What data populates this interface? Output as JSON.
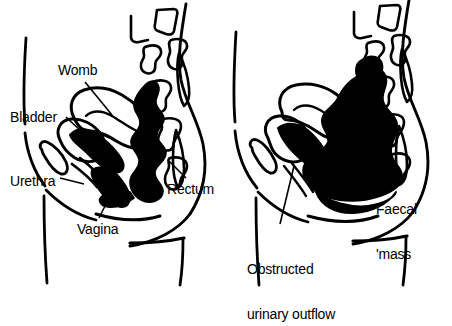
{
  "figure": {
    "type": "medical-line-diagram",
    "background_color": "#ffffff",
    "ink_color": "#000000",
    "panel_count": 2
  },
  "panels": [
    {
      "id": "normal",
      "name": "normal-pelvis-panel",
      "labels": [
        {
          "id": "womb",
          "name": "label-womb",
          "text": "Womb",
          "x": 58,
          "y": 63,
          "leader": true
        },
        {
          "id": "bladder",
          "name": "label-bladder",
          "text": "Bladder",
          "x": 10,
          "y": 110,
          "leader": true
        },
        {
          "id": "urethra",
          "name": "label-urethra",
          "text": "Urethra",
          "x": 10,
          "y": 174,
          "leader": true
        },
        {
          "id": "vagina",
          "name": "label-vagina",
          "text": "Vagina",
          "x": 77,
          "y": 222,
          "leader": true
        },
        {
          "id": "rectum",
          "name": "label-rectum",
          "text": "Rectum",
          "x": 167,
          "y": 182,
          "leader": true
        }
      ]
    },
    {
      "id": "impacted",
      "name": "impacted-pelvis-panel",
      "labels": [
        {
          "id": "faecal-mass",
          "name": "label-faecal-mass",
          "text_line1": "Faecal",
          "text_line2": "'mass",
          "x": 376,
          "y": 172,
          "leader": true
        },
        {
          "id": "obstructed-urinary-outflow",
          "name": "label-obstructed-urinary-outflow",
          "text_line1": "Obstructed",
          "text_line2": "urinary outflow",
          "x": 247,
          "y": 232,
          "leader": true
        }
      ]
    }
  ],
  "anatomy": {
    "normal": [
      {
        "key": "body-outline",
        "name": "body-outline",
        "fill": "none",
        "note": "abdominal wall, back, buttock and thigh contour lines"
      },
      {
        "key": "spine",
        "name": "spine-vertebrae",
        "fill": "none",
        "note": "sacral and lumbar vertebrae drawn as open outlines"
      },
      {
        "key": "womb",
        "name": "womb-organ",
        "fill": "none",
        "note": "uterus drawn as open outline, anteverted"
      },
      {
        "key": "bladder",
        "name": "bladder-organ",
        "fill": "none",
        "note": "bladder outline anterior to uterus"
      },
      {
        "key": "urethra",
        "name": "urethra-organ",
        "fill": "none",
        "note": "narrow open tube below bladder"
      },
      {
        "key": "vagina",
        "name": "vagina-organ",
        "fill": "none",
        "note": "open channel between urethra and rectum"
      },
      {
        "key": "rectum",
        "name": "rectum-organ",
        "fill": "#000000",
        "note": "lumpy solid black column of normal stool"
      },
      {
        "key": "bowel",
        "name": "bowel-loops",
        "fill": "#000000",
        "note": "solid black bowel loops above the pelvic floor"
      }
    ],
    "impacted": [
      {
        "key": "body-outline",
        "name": "body-outline",
        "fill": "none",
        "note": "same body contour as normal panel"
      },
      {
        "key": "spine",
        "name": "spine-vertebrae",
        "fill": "none",
        "note": "sacral and lumbar vertebrae drawn as open outlines"
      },
      {
        "key": "womb",
        "name": "womb-organ",
        "fill": "none",
        "note": "uterus displaced and compressed forward"
      },
      {
        "key": "bladder",
        "name": "bladder-organ",
        "fill": "none",
        "note": "bladder compressed anteriorly"
      },
      {
        "key": "urethra",
        "name": "urethra-organ",
        "fill": "none",
        "note": "urethra pinched closed by the mass"
      },
      {
        "key": "faecal-mass",
        "name": "faecal-mass",
        "fill": "#000000",
        "note": "greatly enlarged solid black impacted stool filling the pelvis"
      }
    ]
  }
}
